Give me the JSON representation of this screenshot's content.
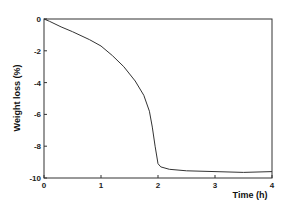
{
  "chart_data": {
    "type": "line",
    "title": "",
    "xlabel": "Time (h)",
    "ylabel": "Weight loss (%)",
    "xlim": [
      0,
      4
    ],
    "ylim": [
      -10,
      0
    ],
    "xticks": [
      "0",
      "1",
      "2",
      "3",
      "4"
    ],
    "yticks": [
      "0",
      "-2",
      "-4",
      "-6",
      "-8",
      "-10"
    ],
    "grid": false,
    "legend": null,
    "series": [
      {
        "name": "Weight loss",
        "x": [
          0,
          0.1,
          0.3,
          0.5,
          0.8,
          1.0,
          1.2,
          1.4,
          1.6,
          1.75,
          1.85,
          1.9,
          1.95,
          2.0,
          2.05,
          2.2,
          2.5,
          3.0,
          3.5,
          4.0
        ],
        "y": [
          0,
          -0.15,
          -0.5,
          -0.8,
          -1.3,
          -1.7,
          -2.3,
          -3.0,
          -3.9,
          -4.8,
          -5.8,
          -6.8,
          -8.0,
          -9.1,
          -9.3,
          -9.45,
          -9.55,
          -9.6,
          -9.65,
          -9.6
        ]
      }
    ]
  }
}
